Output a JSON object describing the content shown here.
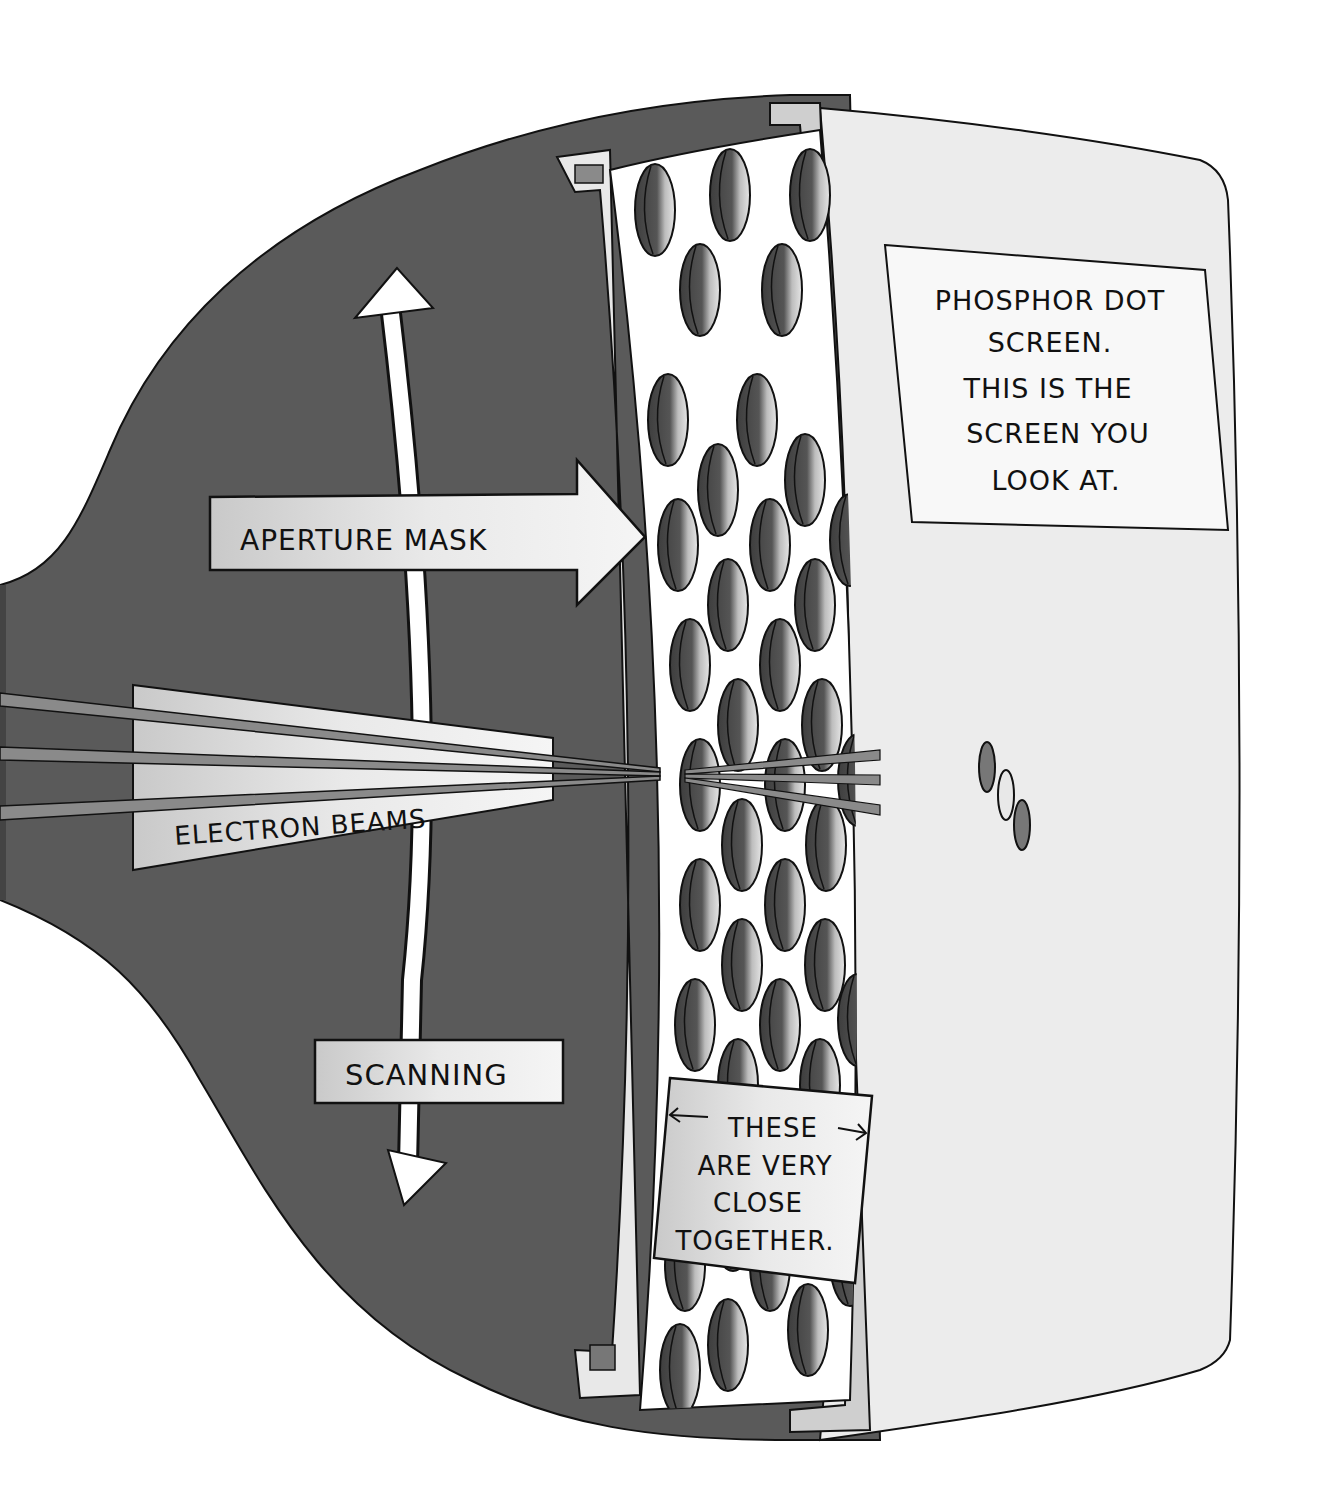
{
  "diagram": {
    "labels": {
      "aperture_mask": "APERTURE MASK",
      "electron_beams": "ELECTRON BEAMS",
      "scanning": "SCANNING",
      "screen_note": {
        "line1": "PHOSPHOR DOT",
        "line2": "SCREEN.",
        "line3": "THIS IS THE",
        "line4": "SCREEN YOU",
        "line5": "LOOK AT."
      },
      "spacing_note": {
        "line1": "THESE",
        "line2": "ARE VERY",
        "line3": "CLOSE",
        "line4": "TOGETHER."
      }
    },
    "icons": {
      "scan_arrow": "double-headed-curved-arrow",
      "mask_pointer": "right-arrow",
      "spacing_arrows": "left-right-arrows"
    },
    "phosphor_dots": [
      "dark",
      "light",
      "dark"
    ],
    "colors": {
      "tube_body": "#5a5a5a",
      "mask_face": "#ffffff",
      "mask_hole": "#4a4a4a",
      "mask_frame": "#cfcfcf",
      "screen_face": "#ececec",
      "label_fill": "#d8d8d8",
      "outline": "#111111",
      "beam": "#8a8a8a"
    }
  }
}
